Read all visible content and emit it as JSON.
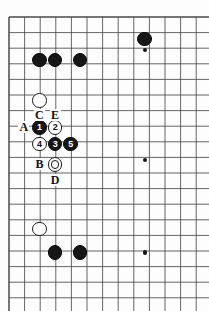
{
  "figure": {
    "kind": "go-board-diagram",
    "title": "",
    "board": {
      "columns": 13,
      "rows": 19,
      "left_px": 9,
      "top_px": 17,
      "cell_px": 15.6,
      "line_color": "#4a4a4a",
      "border_color": "#3a3a3a",
      "background": "#fdfdfd"
    },
    "star_points": [
      {
        "name": "hoshi-upper-right",
        "col": 8.7,
        "row": 2.1
      },
      {
        "name": "hoshi-center-right",
        "col": 8.7,
        "row": 9.15
      },
      {
        "name": "hoshi-lower-right",
        "col": 8.7,
        "row": 15.1
      }
    ],
    "stones": [
      {
        "id": "b-top-1",
        "color": "black",
        "label": "",
        "col": 1.95,
        "row": 2.75
      },
      {
        "id": "b-top-2",
        "color": "black",
        "label": "",
        "col": 2.95,
        "row": 2.75
      },
      {
        "id": "b-top-3",
        "color": "black",
        "label": "",
        "col": 4.55,
        "row": 2.75
      },
      {
        "id": "b-top-4",
        "color": "black",
        "label": "",
        "col": 8.7,
        "row": 1.4
      },
      {
        "id": "w-upper",
        "color": "white",
        "label": "",
        "col": 1.95,
        "row": 5.35
      },
      {
        "id": "move-1",
        "color": "black",
        "label": "1",
        "col": 1.95,
        "row": 7.1
      },
      {
        "id": "move-2",
        "color": "white",
        "label": "2",
        "col": 2.95,
        "row": 7.1
      },
      {
        "id": "move-4",
        "color": "white",
        "label": "4",
        "col": 1.95,
        "row": 8.15
      },
      {
        "id": "move-3",
        "color": "black",
        "label": "3",
        "col": 2.95,
        "row": 8.15
      },
      {
        "id": "move-5",
        "color": "black",
        "label": "5",
        "col": 3.95,
        "row": 8.15
      },
      {
        "id": "w-marked",
        "color": "white",
        "label": "",
        "col": 2.95,
        "row": 9.45,
        "marked": true
      },
      {
        "id": "w-lower",
        "color": "white",
        "label": "",
        "col": 1.95,
        "row": 13.6
      },
      {
        "id": "b-bot-1",
        "color": "black",
        "label": "",
        "col": 2.95,
        "row": 15.1
      },
      {
        "id": "b-bot-2",
        "color": "black",
        "label": "",
        "col": 4.55,
        "row": 15.1
      }
    ],
    "point_labels": [
      {
        "id": "label-C",
        "text": "C",
        "col": 1.95,
        "row": 6.3
      },
      {
        "id": "label-E",
        "text": "E",
        "col": 2.95,
        "row": 6.3
      },
      {
        "id": "label-A",
        "text": "A",
        "col": 0.95,
        "row": 7.1
      },
      {
        "id": "label-B",
        "text": "B",
        "col": 1.95,
        "row": 9.45
      },
      {
        "id": "label-D",
        "text": "D",
        "col": 2.95,
        "row": 10.5
      }
    ],
    "colors": {
      "black_stone": "#161616",
      "white_stone": "#fefefe",
      "stone_outline": "#1a1a1a",
      "grid": "#4a4a4a",
      "text": "#111111"
    }
  }
}
